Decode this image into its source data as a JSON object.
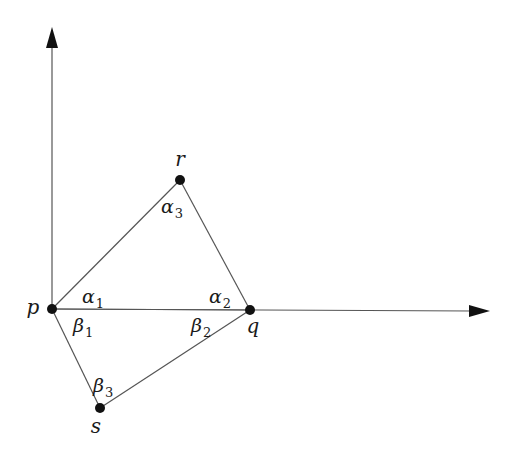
{
  "diagram": {
    "type": "geometry",
    "colors": {
      "line": "#555555",
      "point": "#111111",
      "arrow": "#111111",
      "text": "#1a1a1a",
      "background": "#ffffff"
    },
    "axes": {
      "origin": {
        "x": 52,
        "y": 309
      },
      "y_axis": {
        "x1": 52,
        "y1": 309,
        "x2": 52,
        "y2": 27
      },
      "x_axis": {
        "x1": 52,
        "y1": 309,
        "x2": 490,
        "y2": 311
      }
    },
    "points": [
      {
        "id": "p",
        "label": "p",
        "x": 52,
        "y": 309,
        "label_x": 33,
        "label_y": 314
      },
      {
        "id": "r",
        "label": "r",
        "x": 180,
        "y": 180,
        "label_x": 180,
        "label_y": 166
      },
      {
        "id": "q",
        "label": "q",
        "x": 250,
        "y": 310,
        "label_x": 253,
        "label_y": 333
      },
      {
        "id": "s",
        "label": "s",
        "x": 100,
        "y": 408,
        "label_x": 96,
        "label_y": 433
      }
    ],
    "edges": [
      {
        "from": "p",
        "to": "r"
      },
      {
        "from": "r",
        "to": "q"
      },
      {
        "from": "p",
        "to": "q"
      },
      {
        "from": "p",
        "to": "s"
      },
      {
        "from": "s",
        "to": "q"
      }
    ],
    "angles": [
      {
        "id": "alpha1",
        "symbol": "α",
        "sub": "1",
        "x": 82,
        "y": 303
      },
      {
        "id": "alpha2",
        "symbol": "α",
        "sub": "2",
        "x": 209,
        "y": 303
      },
      {
        "id": "alpha3",
        "symbol": "α",
        "sub": "3",
        "x": 161,
        "y": 213
      },
      {
        "id": "beta1",
        "symbol": "β",
        "sub": "1",
        "x": 73,
        "y": 332
      },
      {
        "id": "beta2",
        "symbol": "β",
        "sub": "2",
        "x": 191,
        "y": 332
      },
      {
        "id": "beta3",
        "symbol": "β",
        "sub": "3",
        "x": 93,
        "y": 392
      }
    ]
  }
}
